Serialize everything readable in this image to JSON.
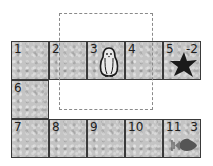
{
  "board": {
    "cells": [
      {
        "number": "1",
        "value": "",
        "row": 0,
        "col": 0,
        "item": ""
      },
      {
        "number": "2",
        "value": "",
        "row": 0,
        "col": 1,
        "item": ""
      },
      {
        "number": "3",
        "value": "",
        "row": 0,
        "col": 2,
        "item": "penguin"
      },
      {
        "number": "4",
        "value": "",
        "row": 0,
        "col": 3,
        "item": ""
      },
      {
        "number": "5",
        "value": "-2",
        "row": 0,
        "col": 4,
        "item": "star"
      },
      {
        "number": "6",
        "value": "",
        "row": 1,
        "col": 0,
        "item": ""
      },
      {
        "number": "7",
        "value": "",
        "row": 2,
        "col": 0,
        "item": ""
      },
      {
        "number": "8",
        "value": "",
        "row": 2,
        "col": 1,
        "item": ""
      },
      {
        "number": "9",
        "value": "",
        "row": 2,
        "col": 2,
        "item": ""
      },
      {
        "number": "10",
        "value": "",
        "row": 2,
        "col": 3,
        "item": ""
      },
      {
        "number": "11",
        "value": "3",
        "row": 2,
        "col": 4,
        "item": "fish"
      }
    ],
    "selection_box": {
      "style": "dashed"
    },
    "colors": {
      "tile": "#c4c4c4",
      "border": "#3a3a3a",
      "star": "#1a1a1a",
      "fish": "#555555"
    }
  }
}
